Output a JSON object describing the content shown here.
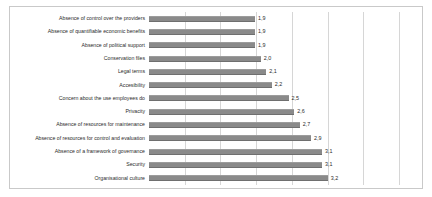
{
  "chart_data": {
    "type": "bar",
    "orientation": "horizontal",
    "title": "",
    "subtitle": "",
    "xlabel": "",
    "ylabel": "",
    "xlim": [
      0,
      4.8
    ],
    "grid": true,
    "grid_axis": "x",
    "grid_interval": 0.64,
    "legend": false,
    "legend_position": "none",
    "bar_color": "#8a8a8a",
    "categories": [
      "Absence of control over the providers",
      "Absence of quantifiable economic benefits",
      "Absence of political support",
      "Conservation files",
      "Legal terms",
      "Accesibility",
      "Concern about the use employees do",
      "Privacity",
      "Absence of resources for maintenance",
      "Absence of resources for control and evaluation",
      "Absence of a framework of governance",
      "Security",
      "Organisational culture"
    ],
    "values": [
      1.9,
      1.9,
      1.9,
      2.0,
      2.1,
      2.2,
      2.5,
      2.6,
      2.7,
      2.9,
      3.1,
      3.1,
      3.2
    ],
    "data_labels": [
      "1,9",
      "1,9",
      "1,9",
      "2,0",
      "2,1",
      "2,2",
      "2,5",
      "2,6",
      "2,7",
      "2,9",
      "3,1",
      "3,1",
      "3,2"
    ]
  }
}
